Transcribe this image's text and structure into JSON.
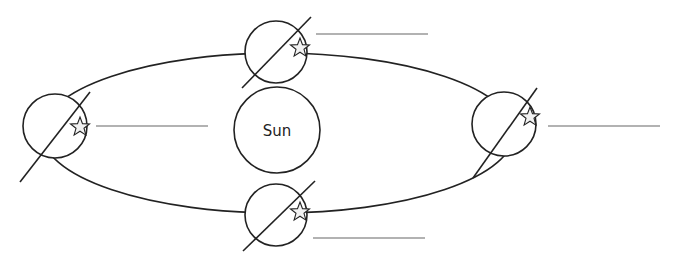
{
  "diagram": {
    "type": "earth-orbit-seasons",
    "colors": {
      "stroke": "#222222",
      "label_line": "#666666",
      "star_fill": "#f2f2f2",
      "background": "#ffffff"
    },
    "orbit": {
      "cx": 278,
      "cy": 133,
      "rx": 236,
      "ry": 80
    },
    "sun": {
      "label": "Sun",
      "cx": 277,
      "cy": 130,
      "r": 43
    },
    "earths": [
      {
        "position": "left",
        "cx": 55,
        "cy": 126,
        "r": 32,
        "axis": [
          20,
          182,
          90,
          92
        ],
        "star": [
          80,
          127
        ],
        "answer_line": [
          96,
          126,
          208,
          126
        ],
        "answer": ""
      },
      {
        "position": "top",
        "cx": 276,
        "cy": 52,
        "r": 31,
        "axis": [
          242,
          88,
          311,
          17
        ],
        "star": [
          300,
          48
        ],
        "answer_line": [
          316,
          34,
          428,
          34
        ],
        "answer": ""
      },
      {
        "position": "right",
        "cx": 504,
        "cy": 124,
        "r": 32,
        "axis": [
          473,
          178,
          537,
          88
        ],
        "star": [
          530,
          117
        ],
        "answer_line": [
          548,
          126,
          660,
          126
        ],
        "answer": ""
      },
      {
        "position": "bottom",
        "cx": 276,
        "cy": 215,
        "r": 31,
        "axis": [
          243,
          251,
          315,
          181
        ],
        "star": [
          300,
          212
        ],
        "answer_line": [
          313,
          238,
          425,
          238
        ],
        "answer": ""
      }
    ]
  }
}
